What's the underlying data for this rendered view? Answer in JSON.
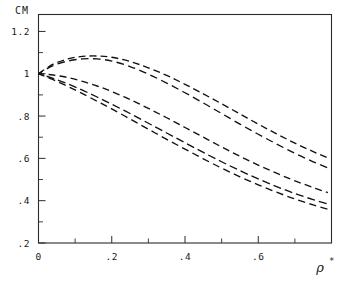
{
  "chart_data": {
    "type": "line",
    "title": "",
    "subtitle": "",
    "ylabel": "CM",
    "xlabel": "ρ",
    "xlabel_superscript": "*",
    "xlim": [
      0,
      0.8
    ],
    "ylim": [
      0.2,
      1.28
    ],
    "grid": false,
    "legend": "none",
    "line_style": "dashed",
    "x_ticks_major": [
      0,
      0.2,
      0.4,
      0.6
    ],
    "x_tick_labels": [
      "0",
      ".2",
      ".4",
      ".6"
    ],
    "x_ticks_minor": [
      0.1,
      0.3,
      0.5,
      0.7
    ],
    "y_ticks_major": [
      0.2,
      0.4,
      0.6,
      0.8,
      1.0,
      1.2
    ],
    "y_tick_labels": [
      ".2",
      ".4",
      ".6",
      ".8",
      "1",
      "1.2"
    ],
    "y_ticks_minor": [
      0.3,
      0.5,
      0.7,
      0.9,
      1.1
    ],
    "series": [
      {
        "name": "curve-1",
        "x": [
          0.0,
          0.04,
          0.08,
          0.12,
          0.16,
          0.2,
          0.25,
          0.3,
          0.35,
          0.4,
          0.45,
          0.5,
          0.55,
          0.6,
          0.65,
          0.7,
          0.75,
          0.79
        ],
        "values": [
          1.0,
          1.045,
          1.07,
          1.082,
          1.084,
          1.078,
          1.058,
          1.028,
          0.992,
          0.95,
          0.905,
          0.858,
          0.81,
          0.762,
          0.716,
          0.672,
          0.632,
          0.602
        ]
      },
      {
        "name": "curve-2",
        "x": [
          0.0,
          0.04,
          0.08,
          0.12,
          0.16,
          0.2,
          0.25,
          0.3,
          0.35,
          0.4,
          0.45,
          0.5,
          0.55,
          0.6,
          0.65,
          0.7,
          0.75,
          0.79
        ],
        "values": [
          1.0,
          1.038,
          1.06,
          1.07,
          1.07,
          1.06,
          1.034,
          0.998,
          0.956,
          0.91,
          0.862,
          0.812,
          0.762,
          0.714,
          0.668,
          0.624,
          0.584,
          0.555
        ]
      },
      {
        "name": "curve-3",
        "x": [
          0.0,
          0.04,
          0.08,
          0.12,
          0.16,
          0.2,
          0.25,
          0.3,
          0.35,
          0.4,
          0.45,
          0.5,
          0.55,
          0.6,
          0.65,
          0.7,
          0.75,
          0.79
        ],
        "values": [
          1.0,
          0.994,
          0.982,
          0.964,
          0.942,
          0.916,
          0.878,
          0.836,
          0.792,
          0.746,
          0.7,
          0.654,
          0.61,
          0.568,
          0.53,
          0.494,
          0.462,
          0.438
        ]
      },
      {
        "name": "curve-4",
        "x": [
          0.0,
          0.04,
          0.08,
          0.12,
          0.16,
          0.2,
          0.25,
          0.3,
          0.35,
          0.4,
          0.45,
          0.5,
          0.55,
          0.6,
          0.65,
          0.7,
          0.75,
          0.79
        ],
        "values": [
          1.0,
          0.978,
          0.952,
          0.922,
          0.89,
          0.856,
          0.812,
          0.766,
          0.72,
          0.674,
          0.628,
          0.584,
          0.542,
          0.503,
          0.467,
          0.434,
          0.405,
          0.384
        ]
      },
      {
        "name": "curve-5",
        "x": [
          0.0,
          0.04,
          0.08,
          0.12,
          0.16,
          0.2,
          0.25,
          0.3,
          0.35,
          0.4,
          0.45,
          0.5,
          0.55,
          0.6,
          0.65,
          0.7,
          0.75,
          0.79
        ],
        "values": [
          1.0,
          0.972,
          0.94,
          0.906,
          0.87,
          0.834,
          0.786,
          0.738,
          0.69,
          0.644,
          0.598,
          0.554,
          0.513,
          0.475,
          0.44,
          0.408,
          0.38,
          0.36
        ]
      }
    ]
  },
  "axes": {
    "y_axis_title": "CM",
    "x_axis_symbol": "ρ",
    "x_axis_superscript": "*"
  },
  "colors": {
    "curve": "#111111",
    "frame": "#2b2b2b",
    "text": "#1a1a1a",
    "background": "#ffffff"
  }
}
